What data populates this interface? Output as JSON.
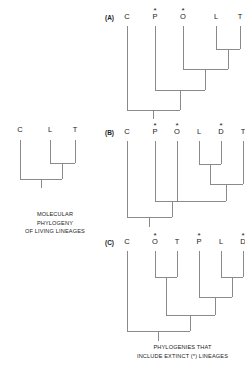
{
  "figure": {
    "background_color": "#ffffff",
    "line_color": "#8a8a8a",
    "text_color": "#1a1a1a",
    "extinct_marker": "*"
  },
  "molecular_tree": {
    "label": "",
    "tips": [
      {
        "name": "C",
        "extinct": false,
        "marker": ""
      },
      {
        "name": "L",
        "extinct": false,
        "marker": ""
      },
      {
        "name": "T",
        "extinct": false,
        "marker": ""
      }
    ],
    "topology": "(C,(L,T))",
    "caption_lines": [
      "MOLECULAR",
      "PHYLOGENY",
      "OF LIVING LINEAGES"
    ]
  },
  "panels": [
    {
      "label": "(A)",
      "tips": [
        {
          "name": "C",
          "extinct": false,
          "marker": ""
        },
        {
          "name": "P",
          "extinct": true,
          "marker": "*"
        },
        {
          "name": "O",
          "extinct": true,
          "marker": "*"
        },
        {
          "name": "L",
          "extinct": false,
          "marker": ""
        },
        {
          "name": "T",
          "extinct": false,
          "marker": ""
        }
      ],
      "topology": "(C,(P,(O,(L,T))))"
    },
    {
      "label": "(B)",
      "tips": [
        {
          "name": "C",
          "extinct": false,
          "marker": ""
        },
        {
          "name": "P",
          "extinct": true,
          "marker": "*"
        },
        {
          "name": "O",
          "extinct": true,
          "marker": "*"
        },
        {
          "name": "L",
          "extinct": false,
          "marker": ""
        },
        {
          "name": "D",
          "extinct": true,
          "marker": "*"
        },
        {
          "name": "T",
          "extinct": false,
          "marker": ""
        }
      ],
      "topology": "(C,(P,(O,((L,D),T))))"
    },
    {
      "label": "(C)",
      "tips": [
        {
          "name": "C",
          "extinct": false,
          "marker": ""
        },
        {
          "name": "O",
          "extinct": true,
          "marker": "*"
        },
        {
          "name": "T",
          "extinct": false,
          "marker": ""
        },
        {
          "name": "P",
          "extinct": true,
          "marker": "*"
        },
        {
          "name": "L",
          "extinct": false,
          "marker": ""
        },
        {
          "name": "D",
          "extinct": true,
          "marker": "*"
        }
      ],
      "topology": "(C,((O,T),(P,(L,D))))"
    }
  ],
  "bottom_caption": {
    "lines": [
      "PHYLOGENIES THAT",
      "INCLUDE EXTINCT (*) LINEAGES"
    ]
  }
}
